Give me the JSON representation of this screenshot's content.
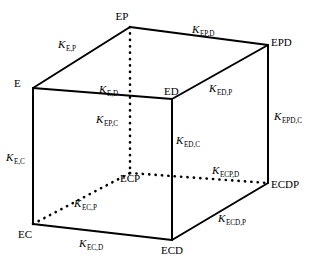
{
  "figure": {
    "type": "thermodynamic-cube-diagram",
    "title": "",
    "background_color": "#ffffff",
    "line_color": "#000000"
  },
  "vertices": [
    {
      "id": "E",
      "label": "E",
      "x": 33,
      "y": 88,
      "label_x": 14,
      "label_y": 87,
      "anchor": "start"
    },
    {
      "id": "EP",
      "label": "EP",
      "x": 130,
      "y": 27,
      "label_x": 122,
      "label_y": 20,
      "anchor": "middle"
    },
    {
      "id": "ED",
      "label": "ED",
      "x": 172,
      "y": 99,
      "label_x": 164,
      "label_y": 95,
      "anchor": "start"
    },
    {
      "id": "EPD",
      "label": "EPD",
      "x": 268,
      "y": 45,
      "label_x": 271,
      "label_y": 46,
      "anchor": "start"
    },
    {
      "id": "EC",
      "label": "EC",
      "x": 33,
      "y": 224,
      "label_x": 18,
      "label_y": 238,
      "anchor": "start"
    },
    {
      "id": "ECP",
      "label": "ECP",
      "x": 130,
      "y": 173,
      "label_x": 130,
      "label_y": 182,
      "anchor": "middle"
    },
    {
      "id": "ECD",
      "label": "ECD",
      "x": 172,
      "y": 240,
      "label_x": 172,
      "label_y": 254,
      "anchor": "middle"
    },
    {
      "id": "ECDP",
      "label": "ECDP",
      "x": 268,
      "y": 183,
      "label_x": 271,
      "label_y": 188,
      "anchor": "start"
    }
  ],
  "edges": [
    {
      "id": "E-EP",
      "from": "E",
      "to": "EP",
      "style": "solid"
    },
    {
      "id": "EP-EPD",
      "from": "EP",
      "to": "EPD",
      "style": "solid"
    },
    {
      "id": "E-ED",
      "from": "E",
      "to": "ED",
      "style": "solid"
    },
    {
      "id": "ED-EPD",
      "from": "ED",
      "to": "EPD",
      "style": "solid"
    },
    {
      "id": "E-EC",
      "from": "E",
      "to": "EC",
      "style": "solid"
    },
    {
      "id": "ED-ECD",
      "from": "ED",
      "to": "ECD",
      "style": "solid"
    },
    {
      "id": "EPD-ECDP",
      "from": "EPD",
      "to": "ECDP",
      "style": "solid"
    },
    {
      "id": "EC-ECD",
      "from": "EC",
      "to": "ECD",
      "style": "solid"
    },
    {
      "id": "ECD-ECDP",
      "from": "ECD",
      "to": "ECDP",
      "style": "solid"
    },
    {
      "id": "EP-ECP",
      "from": "EP",
      "to": "ECP",
      "style": "dotted"
    },
    {
      "id": "EC-ECP",
      "from": "EC",
      "to": "ECP",
      "style": "dotted"
    },
    {
      "id": "ECP-ECDP",
      "from": "ECP",
      "to": "ECDP",
      "style": "dotted"
    }
  ],
  "rate_labels": [
    {
      "id": "K_E_P",
      "base": "K",
      "sub": "E,P",
      "x": 58,
      "y": 48,
      "anchor": "start"
    },
    {
      "id": "K_EP_D",
      "base": "K",
      "sub": "EP,D",
      "x": 192,
      "y": 33,
      "anchor": "start"
    },
    {
      "id": "K_E_D",
      "base": "K",
      "sub": "E,D",
      "x": 99,
      "y": 93,
      "anchor": "start"
    },
    {
      "id": "K_ED_P",
      "base": "K",
      "sub": "ED,P",
      "x": 209,
      "y": 92,
      "anchor": "start"
    },
    {
      "id": "K_EPD_C",
      "base": "K",
      "sub": "EPD,C",
      "x": 274,
      "y": 120,
      "anchor": "start"
    },
    {
      "id": "K_EP_C",
      "base": "K",
      "sub": "EP,C",
      "x": 96,
      "y": 123,
      "anchor": "start"
    },
    {
      "id": "K_ED_C",
      "base": "K",
      "sub": "ED,C",
      "x": 176,
      "y": 144,
      "anchor": "start"
    },
    {
      "id": "K_E_C",
      "base": "K",
      "sub": "E,C",
      "x": 6,
      "y": 161,
      "anchor": "start"
    },
    {
      "id": "K_ECP_D",
      "base": "K",
      "sub": "ECP,D",
      "x": 212,
      "y": 174,
      "anchor": "start"
    },
    {
      "id": "K_EC_P",
      "base": "K",
      "sub": "EC,P",
      "x": 74,
      "y": 207,
      "anchor": "start"
    },
    {
      "id": "K_ECD_P",
      "base": "K",
      "sub": "ECD,P",
      "x": 218,
      "y": 222,
      "anchor": "start"
    },
    {
      "id": "K_EC_D",
      "base": "K",
      "sub": "EC,D",
      "x": 79,
      "y": 247,
      "anchor": "start"
    }
  ]
}
